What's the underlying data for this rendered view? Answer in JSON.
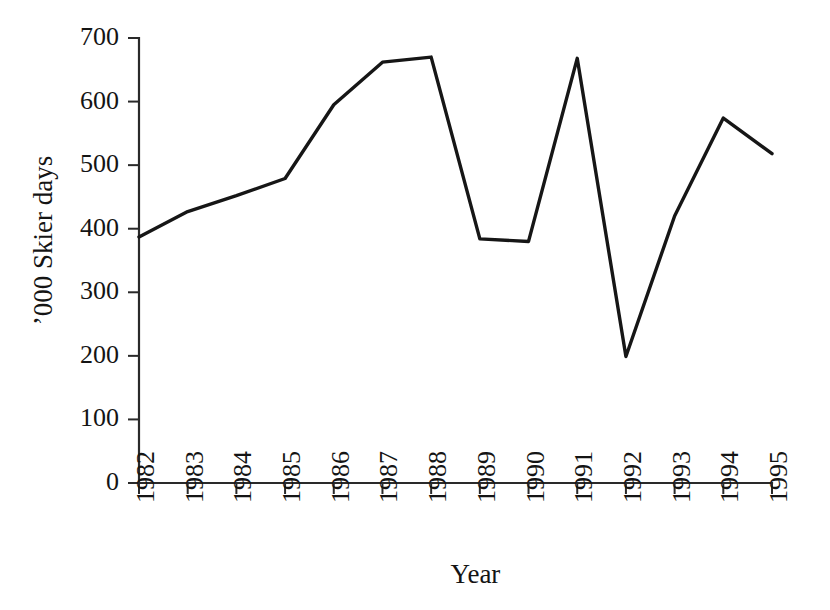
{
  "chart_data": {
    "type": "line",
    "title": "",
    "subtitle": "",
    "xlabel": "Year",
    "ylabel": "’000  Skier days",
    "categories": [
      "1982",
      "1983",
      "1984",
      "1985",
      "1986",
      "1987",
      "1988",
      "1989",
      "1990",
      "1991",
      "1992",
      "1993",
      "1994",
      "1995"
    ],
    "x": [
      1982,
      1983,
      1984,
      1985,
      1986,
      1987,
      1988,
      1989,
      1990,
      1991,
      1992,
      1993,
      1994,
      1995
    ],
    "values": [
      387,
      427,
      452,
      479,
      595,
      662,
      670,
      384,
      380,
      668,
      199,
      420,
      574,
      518
    ],
    "series": [
      {
        "name": "Skier days",
        "values": [
          387,
          427,
          452,
          479,
          595,
          662,
          670,
          384,
          380,
          668,
          199,
          420,
          574,
          518
        ],
        "color": "#161616"
      }
    ],
    "xlim": [
      1982,
      1995
    ],
    "ylim": [
      0,
      700
    ],
    "ytick_labels": [
      "0",
      "100",
      "200",
      "300",
      "400",
      "500",
      "600",
      "700"
    ],
    "yticks": [
      0,
      100,
      200,
      300,
      400,
      500,
      600,
      700
    ],
    "xtick_labels": [
      "1982",
      "1983",
      "1984",
      "1985",
      "1986",
      "1987",
      "1988",
      "1989",
      "1990",
      "1991",
      "1992",
      "1993",
      "1994",
      "1995"
    ],
    "grid": false,
    "legend": "none",
    "xtick_rotation": 90,
    "ylabel_rotation": 90,
    "line_color": "#161616",
    "axis_color": "#2a2a2a",
    "background_color": "#ffffff"
  },
  "labels": {
    "y_axis_title": "’000  Skier days",
    "x_axis_title": "Year"
  }
}
